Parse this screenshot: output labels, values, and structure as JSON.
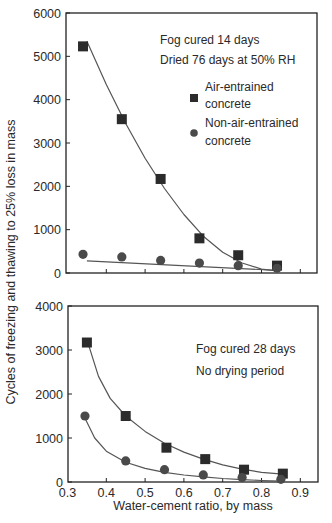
{
  "figure": {
    "ylabel": "Cycles of freezing and thawing to 25% loss in mass",
    "xlabel": "Water-cement ratio, by mass"
  },
  "chart_data": [
    {
      "type": "scatter",
      "title": "",
      "annotations": [
        "Fog cured 14 days",
        "Dried 76 days at 50% RH"
      ],
      "xlabel": "",
      "ylabel": "Cycles of freezing and thawing to 25% loss in mass",
      "xlim": [
        0.3,
        0.95
      ],
      "ylim": [
        0,
        6000
      ],
      "yticks": [
        0,
        1000,
        2000,
        3000,
        4000,
        5000,
        6000
      ],
      "xticks": [
        0.3,
        0.4,
        0.5,
        0.6,
        0.7,
        0.8,
        0.9
      ],
      "xtick_labels_shown": false,
      "grid": false,
      "legend": {
        "position": "upper right",
        "entries": [
          {
            "marker": "square",
            "label_line1": "Air-entrained",
            "label_line2": "concrete"
          },
          {
            "marker": "circle",
            "label_line1": "Non-air-entrained",
            "label_line2": "concrete"
          }
        ]
      },
      "series": [
        {
          "name": "Air-entrained concrete",
          "marker": "square",
          "x": [
            0.34,
            0.44,
            0.54,
            0.64,
            0.74,
            0.84
          ],
          "y": [
            5230,
            3550,
            2170,
            800,
            410,
            170
          ],
          "fit_curve": {
            "x": [
              0.35,
              0.4,
              0.45,
              0.5,
              0.55,
              0.6,
              0.65,
              0.7,
              0.75,
              0.8,
              0.84
            ],
            "y": [
              5350,
              4350,
              3450,
              2650,
              1950,
              1350,
              850,
              480,
              230,
              90,
              50
            ]
          }
        },
        {
          "name": "Non-air-entrained concrete",
          "marker": "circle",
          "x": [
            0.34,
            0.44,
            0.54,
            0.64,
            0.74,
            0.84
          ],
          "y": [
            430,
            370,
            290,
            230,
            170,
            110
          ],
          "fit_curve": {
            "x": [
              0.35,
              0.84
            ],
            "y": [
              280,
              60
            ]
          }
        }
      ]
    },
    {
      "type": "scatter",
      "title": "",
      "annotations": [
        "Fog cured 28 days",
        "No drying period"
      ],
      "xlabel": "Water-cement ratio, by mass",
      "ylabel": "",
      "xlim": [
        0.3,
        0.95
      ],
      "ylim": [
        0,
        4000
      ],
      "yticks": [
        0,
        1000,
        2000,
        3000,
        4000
      ],
      "xticks": [
        0.3,
        0.4,
        0.5,
        0.6,
        0.7,
        0.8,
        0.9
      ],
      "xtick_labels": [
        "0.3",
        "0.4",
        "0.5",
        "0.6",
        "0.7",
        "0.8",
        "0.9"
      ],
      "grid": false,
      "series": [
        {
          "name": "Air-entrained concrete",
          "marker": "square",
          "x": [
            0.35,
            0.45,
            0.555,
            0.655,
            0.755,
            0.855
          ],
          "y": [
            3170,
            1500,
            780,
            520,
            280,
            190
          ],
          "fit_curve": {
            "x": [
              0.355,
              0.38,
              0.41,
              0.45,
              0.5,
              0.55,
              0.6,
              0.65,
              0.7,
              0.75,
              0.8,
              0.855
            ],
            "y": [
              3100,
              2400,
              1900,
              1500,
              1150,
              880,
              680,
              520,
              390,
              290,
              220,
              180
            ]
          }
        },
        {
          "name": "Non-air-entrained concrete",
          "marker": "circle",
          "x": [
            0.345,
            0.45,
            0.55,
            0.65,
            0.75,
            0.85
          ],
          "y": [
            1500,
            480,
            280,
            160,
            100,
            60
          ],
          "fit_curve": {
            "x": [
              0.345,
              0.37,
              0.4,
              0.45,
              0.5,
              0.55,
              0.6,
              0.65,
              0.7,
              0.75,
              0.8,
              0.85
            ],
            "y": [
              1450,
              1000,
              700,
              450,
              310,
              220,
              160,
              115,
              80,
              55,
              35,
              20
            ]
          }
        }
      ]
    }
  ]
}
